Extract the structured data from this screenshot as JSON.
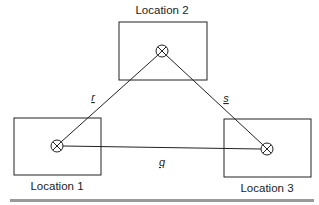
{
  "diagram": {
    "locations": [
      {
        "id": "loc1",
        "label": "Location 1",
        "box": {
          "x": 14,
          "y": 118,
          "w": 87,
          "h": 57
        },
        "node": {
          "cx": 57,
          "cy": 146,
          "r": 6
        },
        "label_pos": {
          "x": 57,
          "y": 190
        }
      },
      {
        "id": "loc2",
        "label": "Location 2",
        "box": {
          "x": 119,
          "y": 22,
          "w": 88,
          "h": 58
        },
        "node": {
          "cx": 162,
          "cy": 51,
          "r": 6
        },
        "label_pos": {
          "x": 162,
          "y": 14
        }
      },
      {
        "id": "loc3",
        "label": "Location 3",
        "box": {
          "x": 224,
          "y": 119,
          "w": 87,
          "h": 58
        },
        "node": {
          "cx": 267,
          "cy": 149,
          "r": 6
        },
        "label_pos": {
          "x": 267,
          "y": 192
        }
      }
    ],
    "edges": [
      {
        "id": "r",
        "label": "r",
        "from": "loc1",
        "to": "loc2",
        "label_pos": {
          "x": 93,
          "y": 101
        }
      },
      {
        "id": "s",
        "label": "s",
        "from": "loc2",
        "to": "loc3",
        "label_pos": {
          "x": 226,
          "y": 102
        }
      },
      {
        "id": "q",
        "label": "q",
        "from": "loc1",
        "to": "loc3",
        "label_pos": {
          "x": 162,
          "y": 166
        }
      }
    ],
    "colors": {
      "stroke": "#222222",
      "footer_bar": "#9a9a9a"
    }
  }
}
